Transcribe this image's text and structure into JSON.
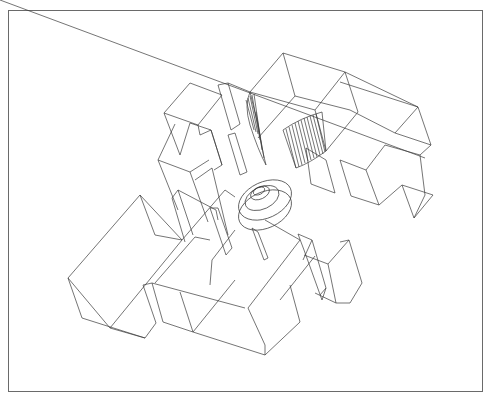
{
  "figure": {
    "line_color": "#3a3a3a",
    "frame_color": "#6a6a6a",
    "background": "#ffffff"
  }
}
